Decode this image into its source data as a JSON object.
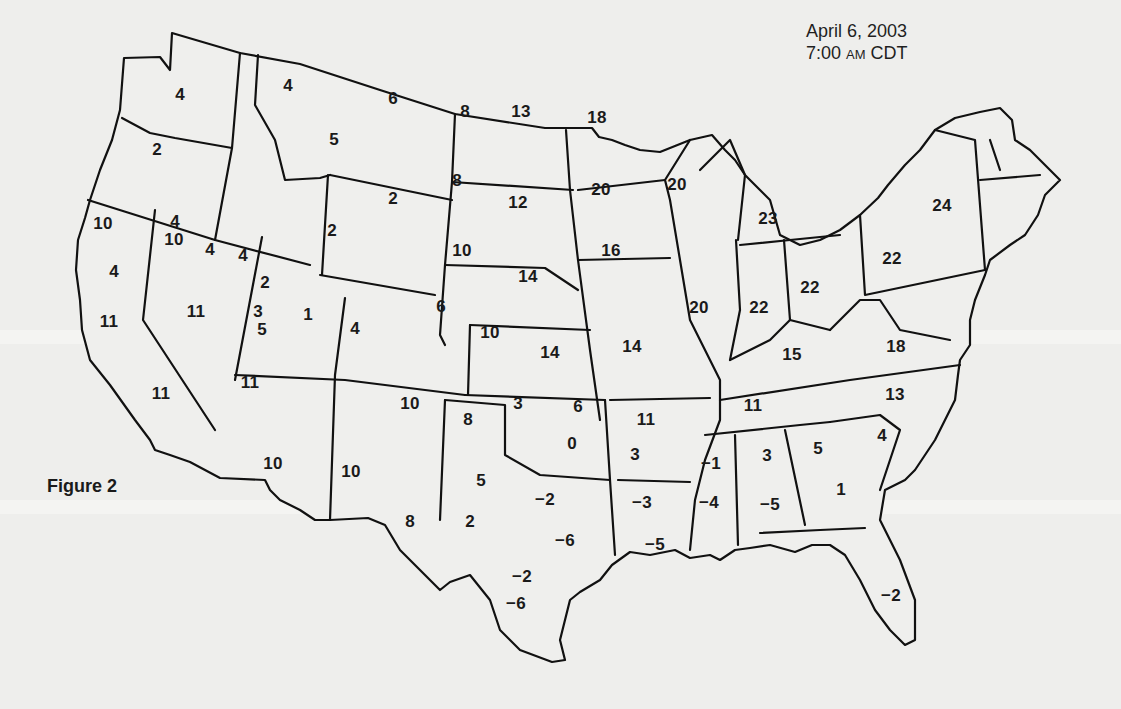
{
  "figure": {
    "label": "Figure 2",
    "date": "April 6, 2003",
    "time_prefix": "7:00 ",
    "time_ampm": "AM",
    "time_zone": " CDT"
  },
  "map": {
    "type": "US contiguous states outline map with station readings",
    "colors": {
      "background": "#eeeeec",
      "stroke": "#111111",
      "text": "#1a1a1a"
    }
  },
  "readings": [
    {
      "region": "Washington",
      "value": "4",
      "x": 180,
      "y": 95
    },
    {
      "region": "Washington",
      "value": "2",
      "x": 157,
      "y": 150
    },
    {
      "region": "Oregon",
      "value": "4",
      "x": 175,
      "y": 222
    },
    {
      "region": "Oregon",
      "value": "4",
      "x": 114,
      "y": 272
    },
    {
      "region": "Idaho",
      "value": "4",
      "x": 243,
      "y": 256
    },
    {
      "region": "Idaho",
      "value": "3",
      "x": 258,
      "y": 312
    },
    {
      "region": "Montana",
      "value": "4",
      "x": 288,
      "y": 86
    },
    {
      "region": "Montana",
      "value": "6",
      "x": 393,
      "y": 99
    },
    {
      "region": "Montana",
      "value": "5",
      "x": 334,
      "y": 140
    },
    {
      "region": "Wyoming",
      "value": "2",
      "x": 393,
      "y": 199
    },
    {
      "region": "Wyoming",
      "value": "2",
      "x": 332,
      "y": 231
    },
    {
      "region": "North Dakota",
      "value": "8",
      "x": 465,
      "y": 112
    },
    {
      "region": "North Dakota",
      "value": "13",
      "x": 521,
      "y": 112
    },
    {
      "region": "South Dakota",
      "value": "8",
      "x": 457,
      "y": 181
    },
    {
      "region": "South Dakota",
      "value": "12",
      "x": 518,
      "y": 203
    },
    {
      "region": "Minnesota",
      "value": "18",
      "x": 597,
      "y": 118
    },
    {
      "region": "Minnesota",
      "value": "20",
      "x": 601,
      "y": 190
    },
    {
      "region": "Wisconsin",
      "value": "20",
      "x": 677,
      "y": 185
    },
    {
      "region": "Michigan",
      "value": "23",
      "x": 768,
      "y": 219
    },
    {
      "region": "New York",
      "value": "24",
      "x": 942,
      "y": 206
    },
    {
      "region": "Pennsylvania",
      "value": "22",
      "x": 892,
      "y": 259
    },
    {
      "region": "California",
      "value": "10",
      "x": 103,
      "y": 224
    },
    {
      "region": "California",
      "value": "11",
      "x": 109,
      "y": 322
    },
    {
      "region": "California",
      "value": "11",
      "x": 161,
      "y": 394
    },
    {
      "region": "Nevada",
      "value": "10",
      "x": 174,
      "y": 240
    },
    {
      "region": "Nevada",
      "value": "4",
      "x": 210,
      "y": 250
    },
    {
      "region": "Nevada",
      "value": "11",
      "x": 196,
      "y": 312
    },
    {
      "region": "Utah",
      "value": "2",
      "x": 265,
      "y": 283
    },
    {
      "region": "Utah",
      "value": "1",
      "x": 308,
      "y": 315
    },
    {
      "region": "Utah",
      "value": "5",
      "x": 262,
      "y": 330
    },
    {
      "region": "Colorado",
      "value": "4",
      "x": 355,
      "y": 329
    },
    {
      "region": "Colorado",
      "value": "6",
      "x": 441,
      "y": 307
    },
    {
      "region": "Nebraska",
      "value": "10",
      "x": 462,
      "y": 251
    },
    {
      "region": "Nebraska",
      "value": "14",
      "x": 528,
      "y": 277
    },
    {
      "region": "Kansas",
      "value": "10",
      "x": 490,
      "y": 333
    },
    {
      "region": "Kansas",
      "value": "14",
      "x": 550,
      "y": 353
    },
    {
      "region": "Iowa",
      "value": "16",
      "x": 611,
      "y": 251
    },
    {
      "region": "Missouri",
      "value": "14",
      "x": 632,
      "y": 347
    },
    {
      "region": "Illinois",
      "value": "20",
      "x": 699,
      "y": 308
    },
    {
      "region": "Indiana",
      "value": "22",
      "x": 759,
      "y": 308
    },
    {
      "region": "Ohio",
      "value": "22",
      "x": 810,
      "y": 288
    },
    {
      "region": "Kentucky",
      "value": "15",
      "x": 792,
      "y": 355
    },
    {
      "region": "West Virginia / Virginia",
      "value": "18",
      "x": 896,
      "y": 347
    },
    {
      "region": "Arizona",
      "value": "11",
      "x": 250,
      "y": 383
    },
    {
      "region": "Arizona",
      "value": "10",
      "x": 273,
      "y": 464
    },
    {
      "region": "New Mexico",
      "value": "10",
      "x": 410,
      "y": 404
    },
    {
      "region": "New Mexico",
      "value": "10",
      "x": 351,
      "y": 472
    },
    {
      "region": "Oklahoma",
      "value": "3",
      "x": 518,
      "y": 404
    },
    {
      "region": "Oklahoma",
      "value": "6",
      "x": 578,
      "y": 407
    },
    {
      "region": "Oklahoma",
      "value": "0",
      "x": 572,
      "y": 444
    },
    {
      "region": "Texas",
      "value": "8",
      "x": 468,
      "y": 420
    },
    {
      "region": "Texas",
      "value": "5",
      "x": 481,
      "y": 481
    },
    {
      "region": "Texas",
      "value": "8",
      "x": 410,
      "y": 522
    },
    {
      "region": "Texas",
      "value": "2",
      "x": 470,
      "y": 522
    },
    {
      "region": "Texas",
      "value": "−2",
      "x": 545,
      "y": 500
    },
    {
      "region": "Texas",
      "value": "−6",
      "x": 565,
      "y": 541
    },
    {
      "region": "Texas",
      "value": "−2",
      "x": 522,
      "y": 577
    },
    {
      "region": "Texas",
      "value": "−6",
      "x": 516,
      "y": 604
    },
    {
      "region": "Arkansas",
      "value": "11",
      "x": 646,
      "y": 420
    },
    {
      "region": "Arkansas",
      "value": "3",
      "x": 635,
      "y": 455
    },
    {
      "region": "Louisiana",
      "value": "−3",
      "x": 642,
      "y": 503
    },
    {
      "region": "Louisiana",
      "value": "−5",
      "x": 655,
      "y": 545
    },
    {
      "region": "Tennessee",
      "value": "11",
      "x": 753,
      "y": 406
    },
    {
      "region": "Mississippi",
      "value": "−1",
      "x": 711,
      "y": 464
    },
    {
      "region": "Mississippi",
      "value": "−4",
      "x": 709,
      "y": 503
    },
    {
      "region": "Alabama",
      "value": "3",
      "x": 767,
      "y": 456
    },
    {
      "region": "Alabama",
      "value": "−5",
      "x": 770,
      "y": 505
    },
    {
      "region": "North Carolina",
      "value": "13",
      "x": 895,
      "y": 395
    },
    {
      "region": "South Carolina",
      "value": "4",
      "x": 882,
      "y": 436
    },
    {
      "region": "Georgia",
      "value": "5",
      "x": 818,
      "y": 449
    },
    {
      "region": "Georgia",
      "value": "1",
      "x": 841,
      "y": 490
    },
    {
      "region": "Florida",
      "value": "−2",
      "x": 891,
      "y": 596
    }
  ]
}
